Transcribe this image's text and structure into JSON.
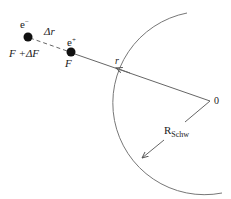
{
  "diagram": {
    "labels": {
      "electron": "e",
      "electron_sup": "−",
      "positron": "e",
      "positron_sup": "+",
      "delta_r": "Δr",
      "force_electron": "F +ΔF",
      "force_positron": "F",
      "radial": "r",
      "origin": "0",
      "radius_main": "R",
      "radius_sub": "Schw"
    },
    "colors": {
      "line": "#6a6a6a",
      "dot": "#111111",
      "text": "#222222"
    }
  }
}
